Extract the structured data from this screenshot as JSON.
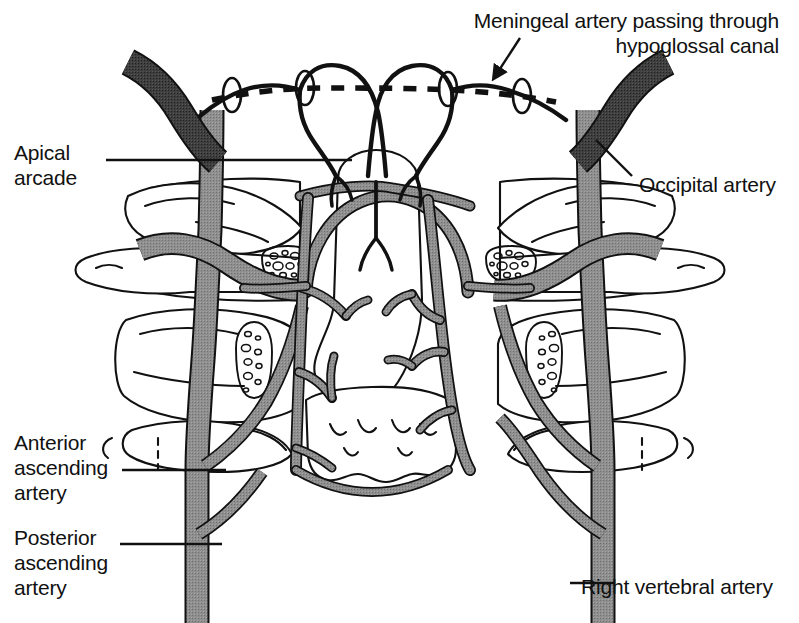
{
  "figure": {
    "kind": "anatomical-line-drawing",
    "background_color": "#ffffff",
    "ink_color": "#111111",
    "artery_fill_gray": "#8a8a8a",
    "artery_fill_dark": "#3d3d3d",
    "bone_fill": "#ffffff"
  },
  "labels": [
    {
      "id": "meningeal",
      "text": "Meningeal artery passing through\nhypoglossal canal",
      "align": "right",
      "x": 779,
      "y": 8,
      "leader": "arrow-down-left"
    },
    {
      "id": "apical-arcade",
      "text": "Apical\narcade",
      "align": "left",
      "x": 14,
      "y": 140,
      "leader": "horizontal-right"
    },
    {
      "id": "occipital",
      "text": "Occipital artery",
      "align": "left",
      "x": 639,
      "y": 172,
      "leader": "diagonal-up-left"
    },
    {
      "id": "anterior-ascending",
      "text": "Anterior\nascending\nartery",
      "align": "left",
      "x": 14,
      "y": 430,
      "leader": "horizontal-right"
    },
    {
      "id": "posterior-ascending",
      "text": "Posterior\nascending\nartery",
      "align": "left",
      "x": 14,
      "y": 525,
      "leader": "horizontal-right"
    },
    {
      "id": "right-vertebral",
      "text": "Right vertebral artery",
      "align": "left",
      "x": 581,
      "y": 574,
      "leader": "horizontal-left"
    }
  ],
  "structures": {
    "occipital_artery_left": "dark band running down-right from upper left",
    "occipital_artery_right": "dark band running down-right at upper right",
    "hypoglossal_canal_markers": "four small ellipses on the dashed meningeal course",
    "meningeal_dashed_course": "dashed line spanning the skull base",
    "vertebral_artery_left": "gray vessel ascending on the left",
    "vertebral_artery_right": "gray vessel ascending on the right",
    "apical_arcade": "arch of vessels over the dens",
    "transverse_foramina": "stippled oval clusters within the lateral masses",
    "vertebrae": "atlas and axis with lateral wings, dens in midline"
  }
}
